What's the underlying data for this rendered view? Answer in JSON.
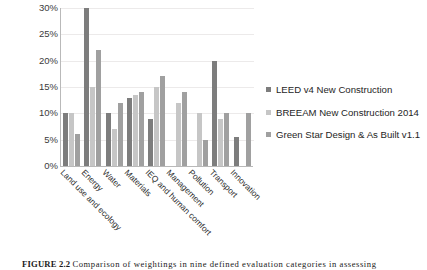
{
  "figure": {
    "caption_label": "FIGURE 2.2",
    "caption_text": "Comparison of weightings in nine defined evaluation categories in assessing"
  },
  "axes": {
    "y_ticks": [
      "30%",
      "25%",
      "20%",
      "15%",
      "10%",
      "5%",
      "0%"
    ]
  },
  "legend": {
    "items": [
      {
        "label": "LEED v4 New Construction",
        "color": "#7d7d7d"
      },
      {
        "label": "BREEAM New Construction 2014",
        "color": "#c6c6c6"
      },
      {
        "label": "Green Star Design & As Built v1.1",
        "color": "#a0a0a0"
      }
    ]
  },
  "chart_data": {
    "type": "bar",
    "title": "",
    "xlabel": "",
    "ylabel": "",
    "ylim": [
      0,
      30
    ],
    "ytick_values": [
      0,
      5,
      10,
      15,
      20,
      25,
      30
    ],
    "ytick_suffix": "%",
    "grid": true,
    "legend_position": "right",
    "categories": [
      "Land use and ecology",
      "Energy",
      "Water",
      "Materials",
      "IEQ and human comfort",
      "Management",
      "Pollution",
      "Transport",
      "Innovation"
    ],
    "series": [
      {
        "name": "LEED v4 New Construction",
        "color": "#7d7d7d",
        "values": [
          10,
          30,
          10,
          13,
          9,
          null,
          null,
          20,
          5.5
        ]
      },
      {
        "name": "BREEAM New Construction 2014",
        "color": "#c6c6c6",
        "values": [
          10,
          15,
          7,
          13.5,
          15,
          12,
          10,
          9,
          null
        ]
      },
      {
        "name": "Green Star Design & As Built v1.1",
        "color": "#a0a0a0",
        "values": [
          6,
          22,
          12,
          14,
          17,
          14,
          5,
          10,
          10
        ]
      }
    ]
  }
}
